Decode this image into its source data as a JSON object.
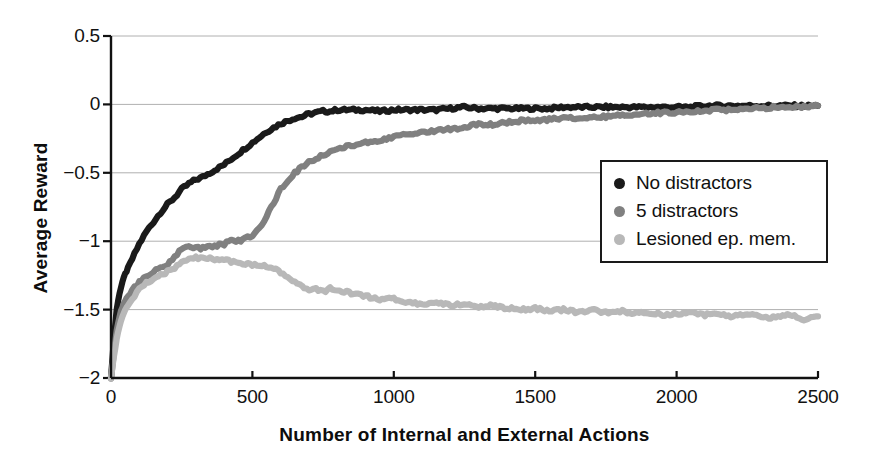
{
  "chart_data": {
    "type": "line",
    "title": "",
    "xlabel": "Number of Internal and External Actions",
    "ylabel": "Average Reward",
    "xlim": [
      0,
      2500
    ],
    "ylim": [
      -2,
      0.5
    ],
    "xticks": [
      "0",
      "500",
      "1000",
      "1500",
      "2000",
      "2500"
    ],
    "xtick_values": [
      0,
      500,
      1000,
      1500,
      2000,
      2500
    ],
    "yticks": [
      "0.5",
      "0",
      "−0.5",
      "−1",
      "−1.5",
      "−2"
    ],
    "ytick_values": [
      0.5,
      0,
      -0.5,
      -1,
      -1.5,
      -2
    ],
    "grid": true,
    "grid_axis": "y",
    "legend_position": "center-right",
    "x": [
      0,
      10,
      20,
      30,
      40,
      50,
      60,
      75,
      100,
      125,
      150,
      175,
      200,
      225,
      250,
      275,
      300,
      325,
      350,
      375,
      400,
      425,
      450,
      475,
      500,
      525,
      550,
      575,
      600,
      625,
      650,
      675,
      700,
      725,
      750,
      775,
      800,
      850,
      900,
      950,
      1000,
      1050,
      1100,
      1150,
      1200,
      1250,
      1300,
      1350,
      1400,
      1450,
      1500,
      1550,
      1600,
      1650,
      1700,
      1750,
      1800,
      1850,
      1900,
      1950,
      2000,
      2050,
      2100,
      2150,
      2200,
      2250,
      2300,
      2350,
      2400,
      2450,
      2500
    ],
    "series": [
      {
        "name": "No distractors",
        "color": "#1a1a1a",
        "marker": "dot",
        "values": [
          -2.0,
          -1.72,
          -1.5,
          -1.38,
          -1.3,
          -1.24,
          -1.2,
          -1.13,
          -1.02,
          -0.93,
          -0.86,
          -0.79,
          -0.73,
          -0.68,
          -0.62,
          -0.58,
          -0.55,
          -0.53,
          -0.5,
          -0.47,
          -0.44,
          -0.4,
          -0.36,
          -0.32,
          -0.28,
          -0.24,
          -0.2,
          -0.17,
          -0.14,
          -0.12,
          -0.1,
          -0.09,
          -0.07,
          -0.06,
          -0.05,
          -0.05,
          -0.04,
          -0.04,
          -0.04,
          -0.05,
          -0.04,
          -0.04,
          -0.04,
          -0.04,
          -0.03,
          -0.02,
          -0.03,
          -0.03,
          -0.03,
          -0.03,
          -0.03,
          -0.03,
          -0.02,
          -0.02,
          -0.02,
          -0.02,
          -0.02,
          -0.02,
          -0.02,
          -0.02,
          -0.02,
          -0.02,
          -0.01,
          -0.01,
          -0.01,
          -0.01,
          -0.01,
          -0.01,
          -0.01,
          -0.01,
          -0.01
        ]
      },
      {
        "name": "5 distractors",
        "color": "#808080",
        "marker": "dot",
        "values": [
          -2.0,
          -1.82,
          -1.65,
          -1.55,
          -1.48,
          -1.44,
          -1.4,
          -1.36,
          -1.3,
          -1.26,
          -1.22,
          -1.2,
          -1.17,
          -1.12,
          -1.05,
          -1.04,
          -1.05,
          -1.05,
          -1.04,
          -1.03,
          -1.02,
          -1.0,
          -1.0,
          -0.98,
          -0.96,
          -0.9,
          -0.82,
          -0.72,
          -0.62,
          -0.56,
          -0.5,
          -0.46,
          -0.42,
          -0.4,
          -0.37,
          -0.34,
          -0.32,
          -0.3,
          -0.28,
          -0.26,
          -0.24,
          -0.22,
          -0.2,
          -0.19,
          -0.18,
          -0.17,
          -0.14,
          -0.15,
          -0.13,
          -0.12,
          -0.12,
          -0.11,
          -0.1,
          -0.1,
          -0.09,
          -0.09,
          -0.08,
          -0.07,
          -0.07,
          -0.06,
          -0.06,
          -0.05,
          -0.05,
          -0.04,
          -0.04,
          -0.03,
          -0.03,
          -0.02,
          -0.02,
          -0.02,
          -0.01
        ]
      },
      {
        "name": "Lesioned ep. mem.",
        "color": "#b8b8b8",
        "marker": "dot",
        "values": [
          -2.0,
          -1.85,
          -1.72,
          -1.62,
          -1.55,
          -1.5,
          -1.46,
          -1.42,
          -1.35,
          -1.3,
          -1.28,
          -1.25,
          -1.22,
          -1.2,
          -1.15,
          -1.13,
          -1.12,
          -1.13,
          -1.12,
          -1.14,
          -1.14,
          -1.15,
          -1.16,
          -1.17,
          -1.17,
          -1.17,
          -1.18,
          -1.2,
          -1.23,
          -1.27,
          -1.3,
          -1.33,
          -1.36,
          -1.35,
          -1.37,
          -1.34,
          -1.36,
          -1.38,
          -1.4,
          -1.43,
          -1.42,
          -1.45,
          -1.46,
          -1.45,
          -1.47,
          -1.46,
          -1.48,
          -1.47,
          -1.49,
          -1.5,
          -1.49,
          -1.51,
          -1.5,
          -1.52,
          -1.5,
          -1.52,
          -1.51,
          -1.53,
          -1.52,
          -1.54,
          -1.53,
          -1.52,
          -1.54,
          -1.53,
          -1.55,
          -1.53,
          -1.55,
          -1.56,
          -1.54,
          -1.57,
          -1.55
        ]
      }
    ]
  },
  "legend": {
    "items": [
      {
        "label": "No distractors",
        "color": "#1a1a1a"
      },
      {
        "label": "5 distractors",
        "color": "#808080"
      },
      {
        "label": "Lesioned ep. mem.",
        "color": "#b8b8b8"
      }
    ]
  },
  "axes": {
    "axis_color": "#111111",
    "grid_color": "#b0b0b0"
  }
}
